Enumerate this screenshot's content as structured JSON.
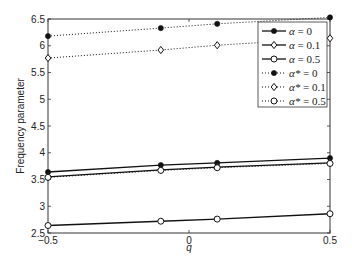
{
  "chart_data": {
    "type": "line",
    "title": "",
    "xlabel": "q",
    "ylabel": "Frequency parameter",
    "xlim": [
      -0.5,
      0.5
    ],
    "ylim": [
      2.5,
      6.5
    ],
    "xticks": [
      "-0.5",
      "0",
      "0.5"
    ],
    "yticks": [
      "2.5",
      "3",
      "3.5",
      "4",
      "4.5",
      "5",
      "5.5",
      "6",
      "6.5"
    ],
    "grid": false,
    "legend_position": "upper right",
    "x": [
      -0.5,
      -0.1,
      0.1,
      0.5
    ],
    "series": [
      {
        "name": "α = 0",
        "label_main": "α",
        "label_rest": " = 0",
        "style": "solid",
        "marker": "star",
        "values": [
          3.64,
          3.77,
          3.81,
          3.9
        ]
      },
      {
        "name": "α = 0.1",
        "label_main": "α",
        "label_rest": " = 0.1",
        "style": "solid",
        "marker": "diamond",
        "values": [
          3.55,
          3.68,
          3.73,
          3.81
        ]
      },
      {
        "name": "α = 0.5",
        "label_main": "α",
        "label_rest": " = 0.5",
        "style": "solid",
        "marker": "circle",
        "values": [
          2.64,
          2.72,
          2.76,
          2.86
        ]
      },
      {
        "name": "α* = 0",
        "label_main": "α*",
        "label_rest": " = 0",
        "style": "dotted",
        "marker": "star",
        "values": [
          6.18,
          6.33,
          6.41,
          6.53
        ]
      },
      {
        "name": "α* = 0.1",
        "label_main": "α*",
        "label_rest": " = 0.1",
        "style": "dotted",
        "marker": "diamond",
        "values": [
          5.77,
          5.92,
          6.01,
          6.14
        ]
      },
      {
        "name": "α* = 0.5",
        "label_main": "α*",
        "label_rest": " = 0.5",
        "style": "dotted",
        "marker": "circle",
        "values": [
          3.54,
          3.67,
          3.72,
          3.8
        ]
      }
    ]
  }
}
